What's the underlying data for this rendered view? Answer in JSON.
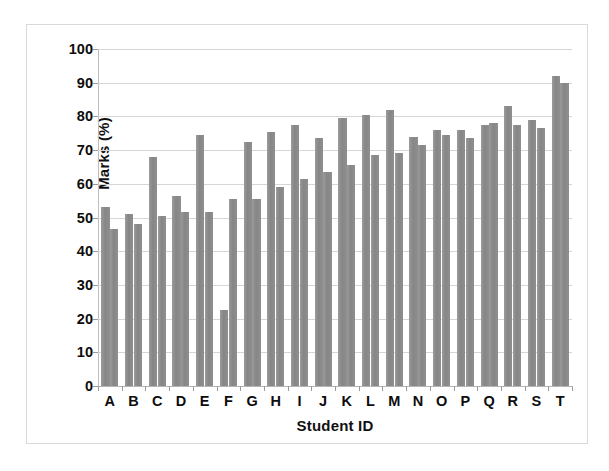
{
  "chart_data": {
    "type": "bar",
    "title": "",
    "xlabel": "Student ID",
    "ylabel": "Marks (%)",
    "categories": [
      "A",
      "B",
      "C",
      "D",
      "E",
      "F",
      "G",
      "H",
      "I",
      "J",
      "K",
      "L",
      "M",
      "N",
      "O",
      "P",
      "Q",
      "R",
      "S",
      "T"
    ],
    "series": [
      {
        "name": "Series 1",
        "values": [
          53,
          51,
          68,
          56.5,
          74.5,
          22.5,
          72.5,
          75.5,
          77.5,
          73.5,
          79.5,
          80.5,
          82,
          74,
          76,
          76,
          77.5,
          83,
          79,
          92
        ]
      },
      {
        "name": "Series 2",
        "values": [
          46.5,
          48,
          50.5,
          51.5,
          51.5,
          55.5,
          55.5,
          59,
          61.5,
          63.5,
          65.5,
          68.5,
          69,
          71.5,
          74.5,
          73.5,
          78,
          77.5,
          76.5,
          90
        ]
      }
    ],
    "ylim": [
      0,
      100
    ],
    "y_ticks": [
      0,
      10,
      20,
      30,
      40,
      50,
      60,
      70,
      80,
      90,
      100
    ],
    "y_tick_labels": [
      "0",
      "10",
      "20",
      "30",
      "40",
      "50",
      "60",
      "70",
      "80",
      "90",
      "100"
    ],
    "grid": true,
    "legend": "none",
    "bar_color": "#8e8e8e",
    "gridline_color": "#d6d6d6",
    "axis_color": "#bdbdbd",
    "border_color": "#d9d9d9",
    "background_color": "#ffffff"
  }
}
